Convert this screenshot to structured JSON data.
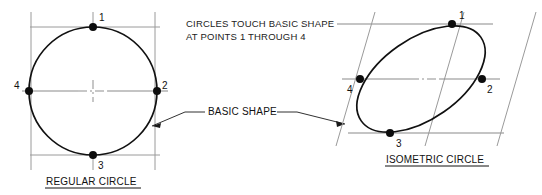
{
  "figure": {
    "title_note": {
      "line1": "CIRCLES TOUCH BASIC SHAPE",
      "line2": "AT POINTS 1 THROUGH 4"
    },
    "callout": {
      "label": "BASIC SHAPE"
    },
    "left_figure": {
      "caption": "REGULAR CIRCLE",
      "point_labels": {
        "p1": "1",
        "p2": "2",
        "p3": "3",
        "p4": "4"
      }
    },
    "right_figure": {
      "caption": "ISOMETRIC CIRCLE",
      "point_labels": {
        "p1": "1",
        "p2": "2",
        "p3": "3",
        "p4": "4"
      }
    },
    "colors": {
      "background": "#ffffff",
      "shape_stroke": "#111111",
      "construction_stroke": "#9a9a9a",
      "text": "#222222"
    }
  }
}
